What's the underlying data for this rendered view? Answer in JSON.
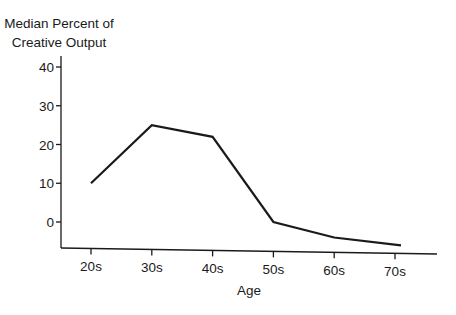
{
  "chart_data": {
    "type": "line",
    "title": "",
    "ylabel": "Median Percent of Creative Output",
    "ylabel_lines": [
      "Median Percent of",
      "Creative Output"
    ],
    "xlabel": "Age",
    "categories": [
      "20s",
      "30s",
      "40s",
      "50s",
      "60s",
      "70s"
    ],
    "values": [
      10,
      25,
      22,
      0,
      -4,
      -6
    ],
    "series": [
      {
        "name": "Median Percent of Creative Output",
        "values": [
          10,
          25,
          22,
          0,
          -4,
          -6
        ]
      }
    ],
    "yticks": [
      0,
      10,
      20,
      30,
      40
    ],
    "ylim": [
      -6.5,
      42
    ],
    "grid": false,
    "legend": null,
    "line_color": "#1a1a1a"
  }
}
